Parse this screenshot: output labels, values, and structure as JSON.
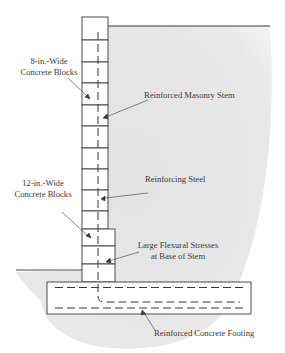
{
  "diagram": {
    "type": "retaining-wall-cross-section",
    "colors": {
      "backfill": "#e6e6e6",
      "line": "#3a3a3a",
      "text": "#3a3a3a",
      "background": "#ffffff"
    },
    "labels": {
      "blocks_8in_line1": "8-in.-Wide",
      "blocks_8in_line2": "Concrete Blocks",
      "masonry_stem": "Reinforced Masonry Stem",
      "blocks_12in_line1": "12-in.-Wide",
      "blocks_12in_line2": "Concrete Blocks",
      "reinforcing_steel": "Reinforcing Steel",
      "flexural_line1": "Large Flexural Stresses",
      "flexural_line2": "at Base of Stem",
      "footing": "Reinforced Concrete Footing"
    },
    "components": [
      {
        "name": "8-in.-wide concrete block stem",
        "block_count": 10
      },
      {
        "name": "12-in.-wide concrete block stem",
        "block_count": 3
      },
      {
        "name": "reinforcing steel",
        "shape": "vertical bar with 90-degree hook into footing"
      },
      {
        "name": "reinforced concrete footing",
        "rebar_layers": 2
      },
      {
        "name": "retained soil (backfill)"
      }
    ]
  }
}
